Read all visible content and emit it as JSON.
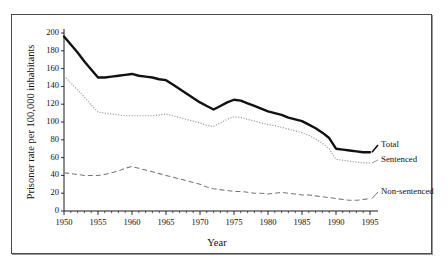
{
  "chart_data": {
    "type": "line",
    "title": "",
    "xlabel": "Year",
    "ylabel": "Prisoner rate per 100,000 inhabitants",
    "xlim": [
      1950,
      1995
    ],
    "ylim": [
      0,
      200
    ],
    "ytick_labels": [
      "0",
      "20",
      "40",
      "60",
      "80",
      "100",
      "120",
      "140",
      "160",
      "180",
      "200"
    ],
    "ytick_values": [
      0,
      20,
      40,
      60,
      80,
      100,
      120,
      140,
      160,
      180,
      200
    ],
    "xtick_labels": [
      "1950",
      "1955",
      "1960",
      "1965",
      "1970",
      "1975",
      "1980",
      "1985",
      "1990",
      "1995"
    ],
    "xtick_values": [
      1950,
      1955,
      1960,
      1965,
      1970,
      1975,
      1980,
      1985,
      1990,
      1995
    ],
    "grid": false,
    "legend_position": "right-inline-labels",
    "x": [
      1950,
      1951,
      1952,
      1953,
      1954,
      1955,
      1956,
      1957,
      1958,
      1959,
      1960,
      1961,
      1962,
      1963,
      1964,
      1965,
      1966,
      1967,
      1968,
      1969,
      1970,
      1971,
      1972,
      1973,
      1974,
      1975,
      1976,
      1977,
      1978,
      1979,
      1980,
      1981,
      1982,
      1983,
      1984,
      1985,
      1986,
      1987,
      1988,
      1989,
      1990,
      1991,
      1992,
      1993,
      1994,
      1995
    ],
    "series": [
      {
        "name": "Total",
        "style": "solid-thick",
        "color": "#111111",
        "label": "Total",
        "values": [
          196,
          187,
          178,
          168,
          159,
          150,
          150,
          151,
          152,
          153,
          154,
          152,
          151,
          150,
          148,
          147,
          142,
          137,
          132,
          127,
          122,
          118,
          114,
          118,
          122,
          125,
          124,
          121,
          118,
          115,
          112,
          110,
          108,
          105,
          103,
          101,
          97,
          93,
          88,
          82,
          70,
          69,
          68,
          67,
          66,
          66
        ]
      },
      {
        "name": "Sentenced",
        "style": "dotted",
        "color": "#9b9b9b",
        "label": "Sentenced",
        "values": [
          152,
          144,
          136,
          128,
          119,
          111,
          110,
          109,
          108,
          107,
          107,
          107,
          107,
          107,
          108,
          109,
          107,
          105,
          103,
          101,
          99,
          96,
          95,
          99,
          103,
          106,
          105,
          103,
          101,
          99,
          97,
          96,
          94,
          92,
          90,
          88,
          85,
          81,
          76,
          70,
          58,
          57,
          56,
          55,
          54,
          54
        ]
      },
      {
        "name": "Non-sentenced",
        "style": "dashed",
        "color": "#777777",
        "label": "Non-sentenced",
        "values": [
          43,
          42,
          41,
          40,
          40,
          40,
          41,
          43,
          45,
          48,
          50,
          48,
          46,
          44,
          42,
          40,
          38,
          36,
          34,
          32,
          30,
          27,
          25,
          24,
          23,
          22,
          22,
          21,
          20,
          20,
          19,
          20,
          21,
          20,
          19,
          18,
          18,
          17,
          16,
          15,
          14,
          13,
          12,
          12,
          13,
          14
        ]
      }
    ]
  },
  "labels": {
    "total": "Total",
    "sentenced": "Sentenced",
    "non_sentenced": "Non-sentenced"
  }
}
